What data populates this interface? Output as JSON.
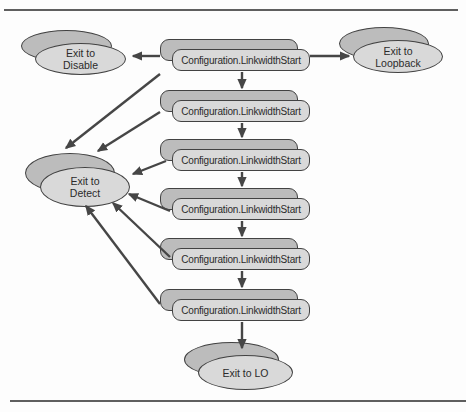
{
  "diagram": {
    "type": "state-flow",
    "states": [
      {
        "id": "state-1",
        "label": "Configuration.LinkwidthStart"
      },
      {
        "id": "state-2",
        "label": "Configuration.LinkwidthStart"
      },
      {
        "id": "state-3",
        "label": "Configuration.LinkwidthStart"
      },
      {
        "id": "state-4",
        "label": "Configuration.LinkwidthStart"
      },
      {
        "id": "state-5",
        "label": "Configuration.LinkwidthStart"
      },
      {
        "id": "state-6",
        "label": "Configuration.LinkwidthStart"
      }
    ],
    "exits": [
      {
        "id": "exit-disable",
        "label": "Exit to\nDisable"
      },
      {
        "id": "exit-loopback",
        "label": "Exit to\nLoopback"
      },
      {
        "id": "exit-detect",
        "label": "Exit to\nDetect"
      },
      {
        "id": "exit-l0",
        "label": "Exit to LO"
      }
    ],
    "edges": [
      {
        "from": "state-1",
        "to": "exit-disable"
      },
      {
        "from": "state-1",
        "to": "exit-loopback"
      },
      {
        "from": "state-1",
        "to": "state-2"
      },
      {
        "from": "state-1",
        "to": "exit-detect"
      },
      {
        "from": "state-2",
        "to": "state-3"
      },
      {
        "from": "state-2",
        "to": "exit-detect"
      },
      {
        "from": "state-3",
        "to": "state-4"
      },
      {
        "from": "state-3",
        "to": "exit-detect"
      },
      {
        "from": "state-4",
        "to": "state-5"
      },
      {
        "from": "state-4",
        "to": "exit-detect"
      },
      {
        "from": "state-5",
        "to": "state-6"
      },
      {
        "from": "state-5",
        "to": "exit-detect"
      },
      {
        "from": "state-6",
        "to": "exit-l0"
      },
      {
        "from": "state-6",
        "to": "exit-detect"
      }
    ],
    "colors": {
      "node_face": "#d9d9d9",
      "node_shadow": "#bcbcbc",
      "outline": "#424242",
      "arrow": "#464646",
      "text": "#2b2b2b",
      "rule": "#5f5f5f",
      "background": "#fdfdfd"
    }
  }
}
